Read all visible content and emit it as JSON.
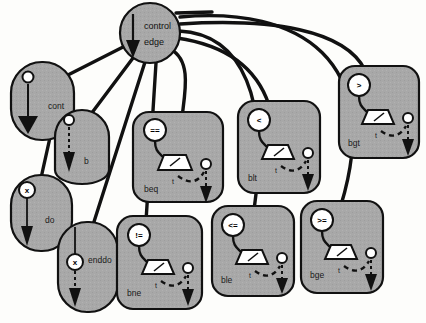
{
  "diagram": {
    "colors": {
      "node_fill": "#a8a8a8",
      "node_stroke": "#1a1a1a",
      "page_bg": "#fdfdfb",
      "white": "#ffffff",
      "ink": "#111111"
    },
    "center_node": {
      "id": "control-edge",
      "label_line1": "control",
      "label_line2": "edge",
      "shape": "circle",
      "cx": 150,
      "cy": 33,
      "r": 30
    },
    "nodes": [
      {
        "id": "cont",
        "label": "cont",
        "shape": "rounded-ellipse",
        "x": 11,
        "y": 62,
        "w": 63,
        "h": 78,
        "label_x": 48,
        "label_y": 106,
        "glyph": "circle-arrow-solid",
        "op": null
      },
      {
        "id": "b",
        "label": "b",
        "shape": "rounded-rect",
        "x": 55,
        "y": 110,
        "w": 54,
        "h": 74,
        "label_x": 90,
        "label_y": 166,
        "glyph": "circle-dashed-arrow",
        "op": null
      },
      {
        "id": "do",
        "label": "do",
        "shape": "rounded-ellipse",
        "x": 11,
        "y": 175,
        "w": 61,
        "h": 76,
        "label_x": 48,
        "label_y": 222,
        "glyph": "x-circle-arrow-solid",
        "op": "x"
      },
      {
        "id": "enddo",
        "label": "enddo",
        "shape": "rounded-ellipse",
        "x": 58,
        "y": 222,
        "w": 60,
        "h": 90,
        "label_x": 92,
        "label_y": 260,
        "glyph": "line-x-circle-dashed-arrow",
        "op": "x"
      },
      {
        "id": "beq",
        "label": "beq",
        "shape": "rounded-rect",
        "x": 133,
        "y": 112,
        "w": 90,
        "h": 90,
        "label_x": 148,
        "label_y": 191,
        "glyph": "branch",
        "op": "=="
      },
      {
        "id": "bne",
        "label": "bne",
        "shape": "rounded-rect",
        "x": 117,
        "y": 216,
        "w": 85,
        "h": 93,
        "label_x": 131,
        "label_y": 295,
        "glyph": "branch",
        "op": "!="
      },
      {
        "id": "blt",
        "label": "blt",
        "shape": "rounded-rect",
        "x": 238,
        "y": 101,
        "w": 82,
        "h": 92,
        "label_x": 252,
        "label_y": 180,
        "glyph": "branch",
        "op": "<"
      },
      {
        "id": "ble",
        "label": "ble",
        "shape": "rounded-rect",
        "x": 212,
        "y": 206,
        "w": 82,
        "h": 90,
        "label_x": 226,
        "label_y": 282,
        "glyph": "branch",
        "op": "<="
      },
      {
        "id": "bgt",
        "label": "bgt",
        "shape": "rounded-rect",
        "x": 339,
        "y": 66,
        "w": 80,
        "h": 92,
        "label_x": 353,
        "label_y": 145,
        "glyph": "branch",
        "op": ">"
      },
      {
        "id": "bge",
        "label": "bge",
        "shape": "rounded-rect",
        "x": 301,
        "y": 201,
        "w": 82,
        "h": 92,
        "label_x": 315,
        "label_y": 277,
        "glyph": "branch",
        "op": ">="
      }
    ],
    "branch_true_label": "t",
    "edges": [
      {
        "from": "control-edge",
        "to": "cont",
        "kind": "straight"
      },
      {
        "from": "control-edge",
        "to": "b",
        "kind": "straight"
      },
      {
        "from": "control-edge",
        "to": "do",
        "kind": "straight"
      },
      {
        "from": "control-edge",
        "to": "enddo",
        "kind": "straight"
      },
      {
        "from": "control-edge",
        "to": "beq",
        "kind": "curve"
      },
      {
        "from": "control-edge",
        "to": "bne",
        "kind": "straight"
      },
      {
        "from": "control-edge",
        "to": "blt",
        "kind": "curve"
      },
      {
        "from": "control-edge",
        "to": "ble",
        "kind": "curve"
      },
      {
        "from": "control-edge",
        "to": "bgt",
        "kind": "curve"
      },
      {
        "from": "control-edge",
        "to": "bge",
        "kind": "curve"
      }
    ]
  }
}
